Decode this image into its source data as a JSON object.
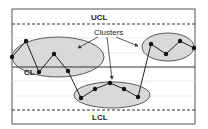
{
  "diagram": {
    "type": "control-chart",
    "labels": {
      "ucl": "UCL",
      "cl": "CL",
      "lcl": "LCL",
      "clusters": "Clusters"
    },
    "colors": {
      "frame": "#555555",
      "lines": "#333333",
      "grid": "#e6e6e6",
      "ellipse_fill": "#d9d9d9",
      "ellipse_stroke": "#333333",
      "point": "#111111"
    },
    "lines": {
      "ucl_y": 24,
      "cl_y": 67,
      "lcl_y": 110
    },
    "clusters": [
      {
        "name": "cluster-1",
        "ellipse": {
          "cx": 58,
          "cy": 57,
          "rx": 46,
          "ry": 20
        },
        "points": [
          [
            12,
            57
          ],
          [
            26,
            41
          ],
          [
            39,
            72
          ],
          [
            54,
            54
          ],
          [
            68,
            71
          ]
        ]
      },
      {
        "name": "cluster-2",
        "ellipse": {
          "cx": 112,
          "cy": 95,
          "rx": 38,
          "ry": 13
        },
        "points": [
          [
            81,
            98
          ],
          [
            95,
            89
          ],
          [
            110,
            83
          ],
          [
            124,
            89
          ],
          [
            138,
            97
          ]
        ]
      },
      {
        "name": "cluster-3",
        "ellipse": {
          "cx": 168,
          "cy": 47,
          "rx": 26,
          "ry": 14
        },
        "points": [
          [
            151,
            44
          ],
          [
            166,
            54
          ],
          [
            180,
            41
          ],
          [
            194,
            48
          ]
        ]
      }
    ]
  }
}
